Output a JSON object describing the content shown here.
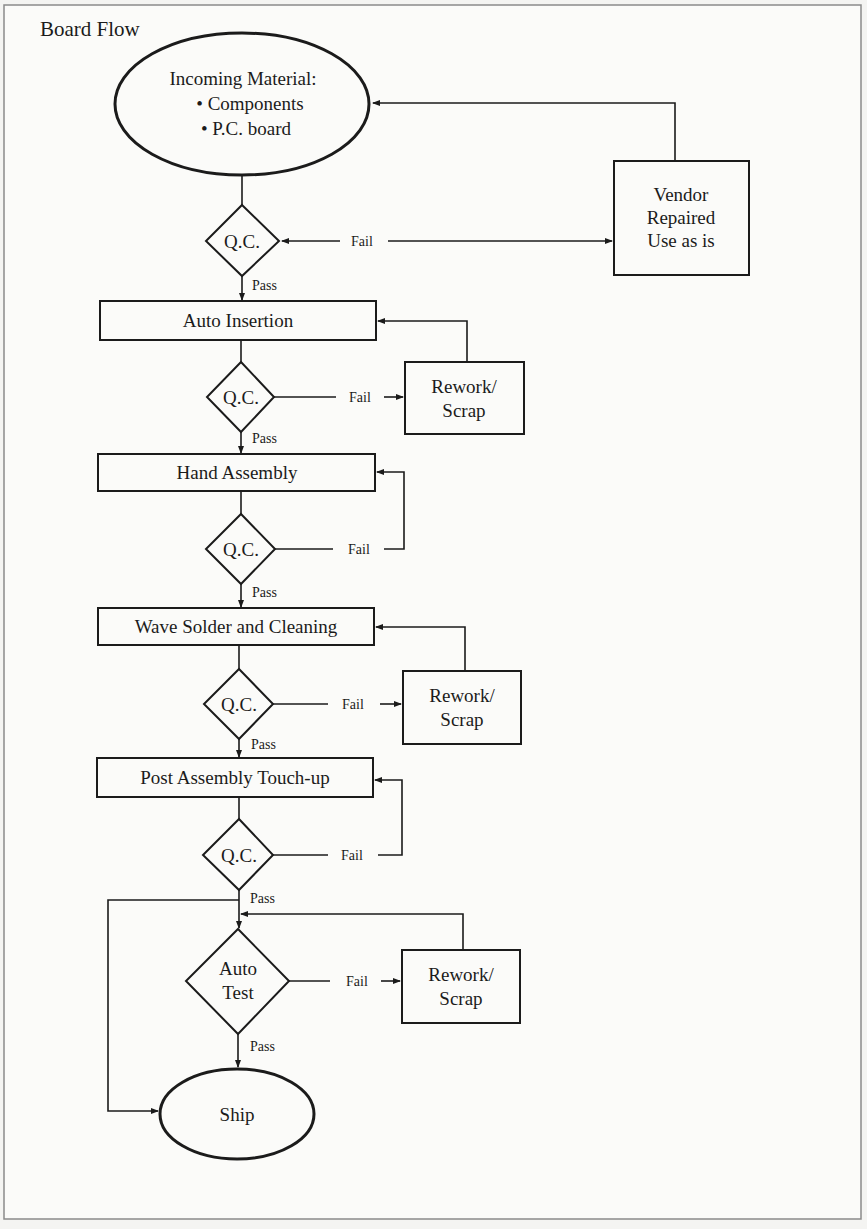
{
  "title": "Board Flow",
  "start": {
    "heading": "Incoming Material:",
    "bullets": [
      "• Components",
      "• P.C. board"
    ]
  },
  "vendor_box": [
    "Vendor",
    "Repaired",
    "Use as is"
  ],
  "steps": [
    "Auto Insertion",
    "Hand Assembly",
    "Wave Solder and Cleaning",
    "Post Assembly Touch-up"
  ],
  "decisions": {
    "qc_label": "Q.C.",
    "auto_test": [
      "Auto",
      "Test"
    ]
  },
  "rework": [
    "Rework/",
    "Scrap"
  ],
  "edge_labels": {
    "pass": "Pass",
    "fail": "Fail"
  },
  "end": "Ship",
  "colors": {
    "ink": "#1b1b1b",
    "paper": "#fbfbf9",
    "frame": "#8a8a8a"
  }
}
